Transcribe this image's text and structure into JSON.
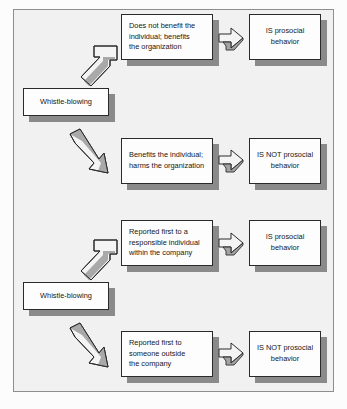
{
  "figure": {
    "frame_color": "#f1f1f1",
    "frame_border_color": "#8e8e8e",
    "box_fill": "#fdfdfd",
    "box_border": "#2a2a2a",
    "shadow_color": "#8a8a8a",
    "arrow_fill": "#f4f4f4",
    "arrow_border": "#2a2a2a",
    "arrow_shade": "#8a8a8a"
  },
  "groups": [
    {
      "source": {
        "label": "Whistle-blowing"
      },
      "branches": [
        {
          "direction": "up",
          "condition": "Does not benefit the\nindividual; benefits\nthe organization",
          "outcome": "IS prosocial\nbehavior"
        },
        {
          "direction": "down",
          "condition": "Benefits the individual;\nharms the organization",
          "outcome": "IS NOT prosocial\nbehavior"
        }
      ]
    },
    {
      "source": {
        "label": "Whistle-blowing"
      },
      "branches": [
        {
          "direction": "up",
          "condition": "Reported first to a\nresponsible individual\nwithin the company",
          "outcome": "IS prosocial\nbehavior"
        },
        {
          "direction": "down",
          "condition": "Reported first to\nsomeone outside\nthe company",
          "outcome": "IS NOT prosocial\nbehavior"
        }
      ]
    }
  ]
}
